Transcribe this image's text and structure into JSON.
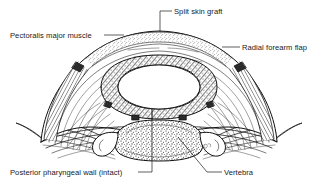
{
  "figure": {
    "type": "line-drawing",
    "background_color": "#ffffff",
    "ink_color": "#111111",
    "width": 318,
    "height": 188
  },
  "labels": {
    "split_skin_graft": "Split skin graft",
    "pectoralis_major_muscle": "Pectoralis major muscle",
    "radial_forearm_flap": "Radial forearm flap",
    "posterior_pharyngeal_wall": "Posterior pharyngeal wall (intact)",
    "vertebra": "Vertebra"
  },
  "structures": [
    {
      "name": "split-skin-graft",
      "description": "outer stippled layer over the arch apex"
    },
    {
      "name": "pectoralis-major-muscle",
      "description": "broad striated muscle arch with concentric fiber lines"
    },
    {
      "name": "radial-forearm-flap",
      "description": "tubed flap forming the neopharyngeal lumen ring"
    },
    {
      "name": "neopharyngeal-lumen",
      "description": "central white oval airway/food passage"
    },
    {
      "name": "posterior-pharyngeal-wall",
      "description": "intact mucosal wall anterior to the vertebra"
    },
    {
      "name": "vertebra",
      "description": "stippled cervical vertebral body with transverse processes"
    },
    {
      "name": "skin-edge-left",
      "description": "hatched cut skin margin, left"
    },
    {
      "name": "skin-edge-right",
      "description": "hatched cut skin margin, right"
    }
  ]
}
